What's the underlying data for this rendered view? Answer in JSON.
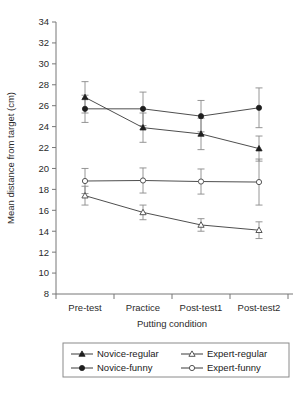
{
  "chart_data": {
    "type": "line",
    "title": "",
    "xlabel": "Putting condition",
    "ylabel": "Mean distance from target (cm)",
    "categories": [
      "Pre-test",
      "Practice",
      "Post-test1",
      "Post-test2"
    ],
    "ylim": [
      8,
      34
    ],
    "ytick_step": 2,
    "yticks": [
      8,
      10,
      12,
      14,
      16,
      18,
      20,
      22,
      24,
      26,
      28,
      30,
      32,
      34
    ],
    "grid": false,
    "legend_position": "bottom",
    "error_bars": "yes",
    "series": [
      {
        "name": "Novice-regular",
        "marker": "filled-triangle",
        "values": [
          26.8,
          23.9,
          23.3,
          21.9
        ],
        "errors": [
          1.5,
          1.4,
          1.5,
          1.2
        ]
      },
      {
        "name": "Novice-funny",
        "marker": "filled-circle",
        "values": [
          25.7,
          25.7,
          25.0,
          25.8
        ],
        "errors": [
          1.3,
          1.6,
          1.5,
          1.9
        ]
      },
      {
        "name": "Expert-regular",
        "marker": "open-triangle",
        "values": [
          17.4,
          15.8,
          14.6,
          14.1
        ],
        "errors": [
          0.9,
          0.7,
          0.6,
          0.8
        ]
      },
      {
        "name": "Expert-funny",
        "marker": "open-circle",
        "values": [
          18.8,
          18.85,
          18.75,
          18.7
        ],
        "errors": [
          1.2,
          1.2,
          1.2,
          2.2
        ]
      }
    ]
  },
  "legend": {
    "entries": [
      {
        "label": "Novice-regular",
        "marker": "filled-triangle"
      },
      {
        "label": "Expert-regular",
        "marker": "open-triangle"
      },
      {
        "label": "Novice-funny",
        "marker": "filled-circle"
      },
      {
        "label": "Expert-funny",
        "marker": "open-circle"
      }
    ]
  },
  "colors": {
    "line": "#3a3a3a",
    "error_bar": "#8a8a8a",
    "axis": "#777777",
    "text": "#1a1a1a",
    "background": "#ffffff"
  }
}
